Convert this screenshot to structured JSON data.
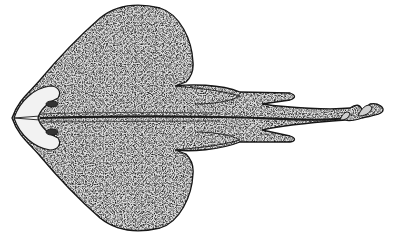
{
  "image": {
    "subject": "skate/ray illustration, dorsal view",
    "style": "black-and-white stippled engraving",
    "background_color": "#ffffff",
    "ink_color": "#1a1a1a",
    "body_fill": "#d9d9d9"
  }
}
